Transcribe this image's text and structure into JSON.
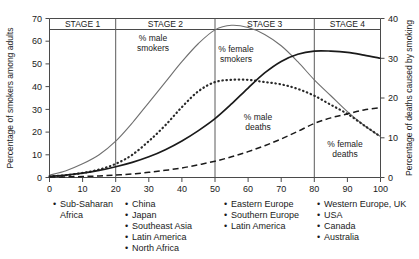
{
  "chart_data": {
    "type": "line",
    "title": "",
    "xlabel": "",
    "ylabel": "Percentage of smokers among adults",
    "y2label": "Percentage of deaths caused by smoking",
    "xlim": [
      0,
      100
    ],
    "ylim": [
      0,
      70
    ],
    "y2lim": [
      0,
      40
    ],
    "xticks": [
      0,
      10,
      20,
      30,
      40,
      50,
      60,
      70,
      80,
      90,
      100
    ],
    "yticks": [
      0,
      10,
      20,
      30,
      40,
      50,
      60,
      70
    ],
    "y2ticks": [
      0,
      10,
      20,
      30,
      40
    ],
    "grid": false,
    "legend_position": "below-axis-columns",
    "stage_boundaries": [
      20,
      50,
      80
    ],
    "series": [
      {
        "name": "% male smokers",
        "axis": "left",
        "style": "thin-solid",
        "x": [
          0,
          5,
          10,
          15,
          20,
          25,
          30,
          35,
          40,
          45,
          50,
          55,
          60,
          65,
          70,
          75,
          80,
          85,
          90,
          95,
          100
        ],
        "values": [
          1,
          3,
          6,
          10,
          16,
          24,
          33,
          42,
          51,
          59,
          65,
          67,
          66,
          63,
          58,
          51,
          43,
          36,
          29,
          23,
          18
        ]
      },
      {
        "name": "% female smokers",
        "axis": "left",
        "style": "dotted",
        "x": [
          0,
          5,
          10,
          15,
          20,
          25,
          30,
          35,
          40,
          45,
          50,
          55,
          60,
          65,
          70,
          75,
          80,
          85,
          90,
          95,
          100
        ],
        "values": [
          0.5,
          1,
          2,
          3.5,
          6,
          10,
          16,
          23,
          31,
          38,
          42,
          43,
          43,
          42,
          41,
          39,
          36,
          32,
          28,
          23,
          18
        ]
      },
      {
        "name": "% male deaths",
        "axis": "right",
        "style": "thick-solid",
        "x": [
          0,
          5,
          10,
          15,
          20,
          25,
          30,
          35,
          40,
          45,
          50,
          55,
          60,
          65,
          70,
          75,
          80,
          85,
          90,
          95,
          100
        ],
        "values": [
          0.3,
          0.6,
          1.1,
          1.8,
          2.7,
          3.8,
          5.2,
          7.0,
          9.2,
          11.8,
          14.8,
          18.5,
          22.5,
          26.3,
          29.2,
          31.0,
          31.8,
          31.8,
          31.5,
          30.8,
          30.0
        ]
      },
      {
        "name": "% female deaths",
        "axis": "right",
        "style": "dashed",
        "x": [
          0,
          5,
          10,
          15,
          20,
          25,
          30,
          35,
          40,
          45,
          50,
          55,
          60,
          65,
          70,
          75,
          80,
          85,
          90,
          95,
          100
        ],
        "values": [
          0.1,
          0.15,
          0.25,
          0.4,
          0.6,
          0.9,
          1.3,
          1.8,
          2.4,
          3.2,
          4.1,
          5.2,
          6.5,
          8.0,
          9.7,
          11.6,
          13.6,
          15.0,
          16.0,
          17.0,
          17.6
        ]
      }
    ]
  },
  "axes": {
    "left_title": "Percentage of smokers among adults",
    "right_title": "Percentage of deaths caused by smoking",
    "x_tick_labels": [
      "0",
      "10",
      "20",
      "30",
      "40",
      "50",
      "60",
      "70",
      "80",
      "90",
      "100"
    ],
    "y_tick_labels": [
      "0",
      "10",
      "20",
      "30",
      "40",
      "50",
      "60",
      "70"
    ],
    "y2_tick_labels": [
      "0",
      "10",
      "20",
      "30",
      "40"
    ]
  },
  "stages": [
    {
      "label": "STAGE 1"
    },
    {
      "label": "STAGE 2"
    },
    {
      "label": "STAGE 3"
    },
    {
      "label": "STAGE 4"
    }
  ],
  "series_labels": {
    "male_smokers_l1": "% male",
    "male_smokers_l2": "smokers",
    "female_smokers_l1": "% female",
    "female_smokers_l2": "smokers",
    "male_deaths_l1": "% male",
    "male_deaths_l2": "deaths",
    "female_deaths_l1": "% female",
    "female_deaths_l2": "deaths"
  },
  "legend_columns": [
    {
      "items": [
        "Sub-Saharan Africa"
      ]
    },
    {
      "items": [
        "China",
        "Japan",
        "Southeast Asia",
        "Latin America",
        "North Africa"
      ]
    },
    {
      "items": [
        "Eastern Europe",
        "Southern Europe",
        "Latin America"
      ]
    },
    {
      "items": [
        "Western Europe, UK",
        "USA",
        "Canada",
        "Australia"
      ]
    }
  ],
  "colors": {
    "background": "#ffffff",
    "text": "#1a1a1a",
    "axis": "#4a4a4a",
    "divider": "#5a5a5a",
    "male_smokers": "#6f6f6f",
    "female_smokers": "#2a2a2a",
    "male_deaths": "#1a1a1a",
    "female_deaths": "#1a1a1a"
  }
}
